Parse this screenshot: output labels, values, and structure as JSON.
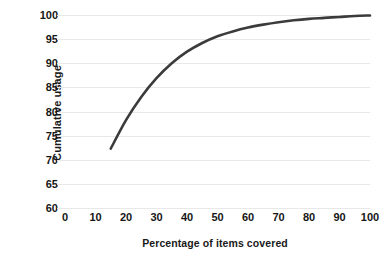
{
  "chart_data": {
    "type": "line",
    "title": "",
    "xlabel": "Percentage of items covered",
    "ylabel": "Cumulative usage",
    "xlim": [
      0,
      100
    ],
    "ylim": [
      60,
      100
    ],
    "grid": "horizontal",
    "legend": "none",
    "line_color": "#3b3b3b",
    "grid_color": "#e8e8e8",
    "text_color": "#161616",
    "background": "#ffffff",
    "xticks": [
      0,
      10,
      20,
      30,
      40,
      50,
      60,
      70,
      80,
      90,
      100
    ],
    "ytick_labels": [
      "100",
      "95",
      "90",
      "85",
      "80",
      "75",
      "70",
      "65",
      "60"
    ],
    "yticks": [
      100,
      95,
      90,
      85,
      80,
      75,
      70,
      65,
      60
    ],
    "series": [
      {
        "name": "Cumulative usage",
        "x": [
          15,
          20,
          25,
          30,
          35,
          40,
          45,
          50,
          55,
          60,
          65,
          70,
          75,
          80,
          85,
          90,
          95,
          100
        ],
        "y": [
          72.3,
          78.2,
          83.0,
          86.9,
          90.0,
          92.4,
          94.2,
          95.6,
          96.6,
          97.4,
          98.0,
          98.5,
          98.9,
          99.2,
          99.4,
          99.6,
          99.8,
          99.9
        ]
      }
    ]
  }
}
